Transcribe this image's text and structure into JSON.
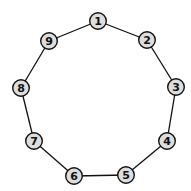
{
  "diagram": {
    "type": "cycle-graph",
    "node_fill": "#dddddd",
    "stroke": "#111111",
    "nodes": [
      {
        "id": "1",
        "label": "1",
        "x": 98,
        "y": 21
      },
      {
        "id": "2",
        "label": "2",
        "x": 147,
        "y": 40
      },
      {
        "id": "3",
        "label": "3",
        "x": 176,
        "y": 87
      },
      {
        "id": "4",
        "label": "4",
        "x": 167,
        "y": 141
      },
      {
        "id": "5",
        "label": "5",
        "x": 126,
        "y": 175
      },
      {
        "id": "6",
        "label": "6",
        "x": 74,
        "y": 176
      },
      {
        "id": "7",
        "label": "7",
        "x": 34,
        "y": 141
      },
      {
        "id": "8",
        "label": "8",
        "x": 21,
        "y": 88
      },
      {
        "id": "9",
        "label": "9",
        "x": 49,
        "y": 41
      }
    ],
    "edges": [
      [
        "1",
        "2"
      ],
      [
        "2",
        "3"
      ],
      [
        "3",
        "4"
      ],
      [
        "4",
        "5"
      ],
      [
        "5",
        "6"
      ],
      [
        "6",
        "7"
      ],
      [
        "7",
        "8"
      ],
      [
        "8",
        "9"
      ],
      [
        "9",
        "1"
      ]
    ]
  }
}
